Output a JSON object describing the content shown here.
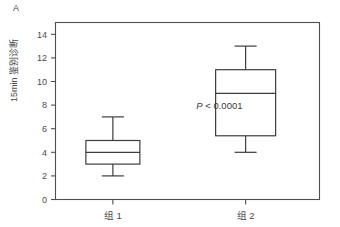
{
  "figure": {
    "panel_label": "A"
  },
  "chart_data": {
    "type": "box",
    "title": "",
    "xlabel": "",
    "ylabel": "15min 鉴别诊断",
    "ylim": [
      0,
      15
    ],
    "yticks": [
      0,
      2,
      4,
      6,
      8,
      10,
      12,
      14
    ],
    "ytick_labels": [
      "0",
      "2",
      "4",
      "6",
      "8",
      "10",
      "12",
      "14"
    ],
    "grid": false,
    "legend": "none",
    "categories": [
      "组 1",
      "组 2"
    ],
    "boxes": [
      {
        "category": "组 1",
        "whisker_low": 2,
        "q1": 3,
        "median": 4,
        "q3": 5,
        "whisker_high": 7
      },
      {
        "category": "组 2",
        "whisker_low": 4,
        "q1": 5.4,
        "median": 9,
        "q3": 11,
        "whisker_high": 13
      }
    ],
    "annotations": [
      {
        "name": "p-value",
        "italic_part": "P",
        "text": " < 0.0001",
        "x_value": 0.62,
        "y_value": 7.7
      }
    ]
  }
}
